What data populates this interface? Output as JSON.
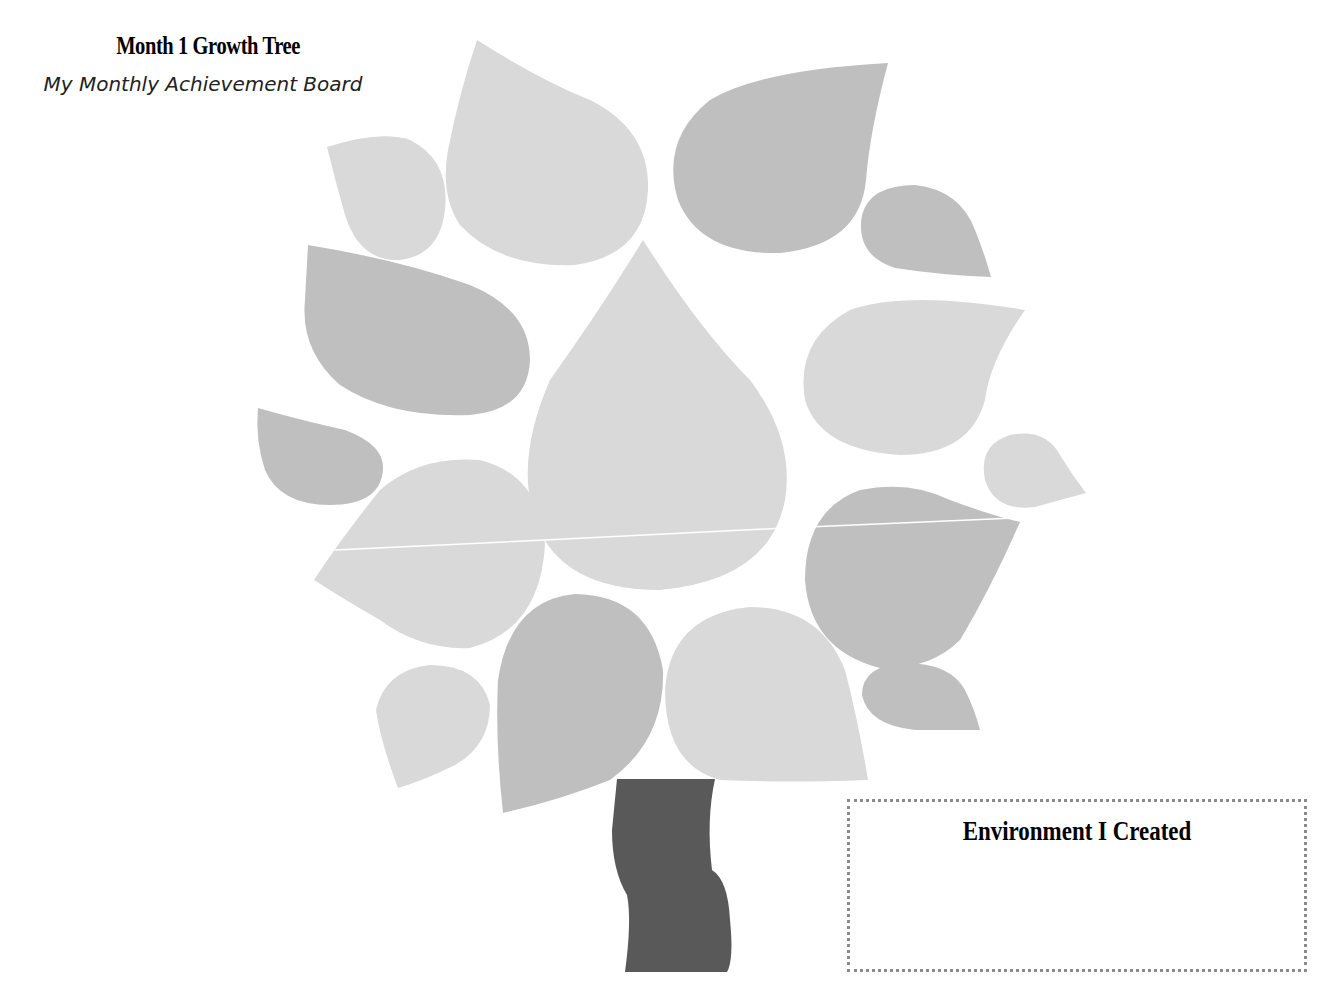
{
  "header": {
    "title": "Month 1 Growth Tree",
    "subtitle": "My Monthly Achievement Board"
  },
  "tree": {
    "leaf_colors": {
      "light": "#d9d9d9",
      "dark": "#bfbfbf"
    },
    "trunk_color": "#595959",
    "leaf_count": 17
  },
  "environment_box": {
    "title": "Environment I Created",
    "content": ""
  }
}
